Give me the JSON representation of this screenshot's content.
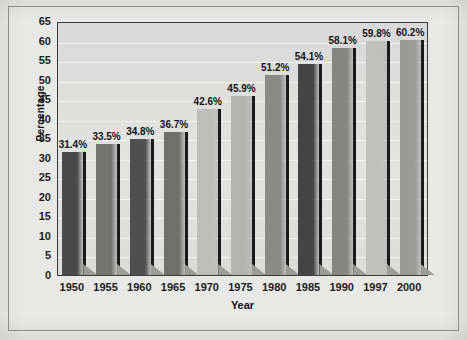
{
  "chart_data": {
    "type": "bar",
    "title": "",
    "subtitle": "",
    "xlabel": "Year",
    "ylabel": "Percentage",
    "categories": [
      "1950",
      "1955",
      "1960",
      "1965",
      "1970",
      "1975",
      "1980",
      "1985",
      "1990",
      "1997",
      "2000"
    ],
    "values": [
      31.4,
      33.5,
      34.8,
      36.7,
      42.6,
      45.9,
      51.2,
      54.1,
      58.1,
      59.8,
      60.2
    ],
    "data_labels": [
      "31.4%",
      "33.5%",
      "34.8%",
      "36.7%",
      "42.6%",
      "45.9%",
      "51.2%",
      "54.1%",
      "58.1%",
      "59.8%",
      "60.2%"
    ],
    "bar_colors": [
      "#4a4a4a",
      "#747472",
      "#4f4f4f",
      "#6f6f6d",
      "#bdbdbb",
      "#b4b4b2",
      "#8a8a88",
      "#444444",
      "#858583",
      "#c0c0be",
      "#9a9a98"
    ],
    "ylim": [
      0,
      65
    ],
    "ytick_step": 5,
    "ytick_labels": [
      "0",
      "5",
      "10",
      "15",
      "20",
      "25",
      "30",
      "35",
      "40",
      "45",
      "50",
      "55",
      "60",
      "65"
    ],
    "grid": true,
    "grid_axis": "y",
    "legend": false,
    "legend_position": "none",
    "orientation": "vertical",
    "value_suffix": "%"
  },
  "figure": {
    "background_color": "#e8e8e6",
    "plot_background_color": "#dedede",
    "frame_color": "#3b3b3b",
    "text_color": "#1c1c1c"
  }
}
